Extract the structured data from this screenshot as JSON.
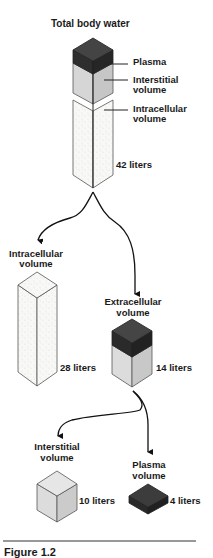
{
  "title": "Total body water",
  "total": {
    "labels": {
      "plasma": "Plasma",
      "interstitial_1": "Interstitial",
      "interstitial_2": "volume",
      "intracellular_1": "Intracellular",
      "intracellular_2": "volume"
    },
    "amount": "42 liters"
  },
  "intracellular": {
    "label_1": "Intracellular",
    "label_2": "volume",
    "amount": "28 liters"
  },
  "extracellular": {
    "label_1": "Extracellular",
    "label_2": "volume",
    "amount": "14 liters"
  },
  "interstitial": {
    "label_1": "Interstitial",
    "label_2": "volume",
    "amount": "10 liters"
  },
  "plasma": {
    "label_1": "Plasma",
    "label_2": "volume",
    "amount": "4 liters"
  },
  "caption": "Figure 1.2",
  "colors": {
    "plasma": "#3a3a3a",
    "plasma_side": "#2a2a2a",
    "interstitial": "#d4d4d4",
    "interstitial_side": "#c4c4c4",
    "intracellular": "#f7f7f5",
    "outline": "#222222"
  }
}
